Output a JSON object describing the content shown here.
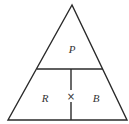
{
  "diagram": {
    "type": "formula-triangle",
    "top_label": "P",
    "bottom_left_label": "R",
    "bottom_right_label": "B",
    "operator": "×",
    "relation": "P = R × B"
  }
}
